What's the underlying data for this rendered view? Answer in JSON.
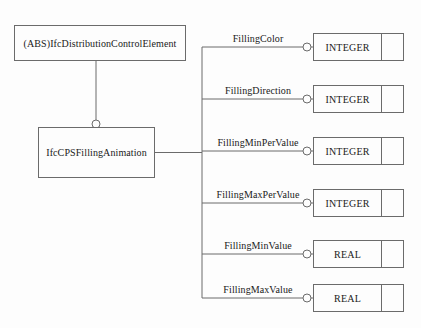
{
  "diagram": {
    "notation": "EXPRESS-G",
    "background_color": "#fdfdfd",
    "line_color": "#6b6b6b",
    "text_color": "#1a1a1a",
    "entities": [
      {
        "id": "parent",
        "label": "(ABS)IfcDistributionControlElement",
        "abstract": true,
        "x": 14,
        "y": 25,
        "width": 172,
        "height": 36
      },
      {
        "id": "child",
        "label": "IfcCPSFillingAnimation",
        "abstract": false,
        "x": 38,
        "y": 127,
        "width": 117,
        "height": 51
      }
    ],
    "inheritance": {
      "from": "child",
      "to": "parent",
      "marker": "circle"
    },
    "attributes": [
      {
        "name": "FillingColor",
        "type": "INTEGER",
        "row_y": 47,
        "label_x": 258
      },
      {
        "name": "FillingDirection",
        "type": "INTEGER",
        "row_y": 99,
        "label_x": 258
      },
      {
        "name": "FillingMinPerValue",
        "type": "INTEGER",
        "row_y": 151,
        "label_x": 258
      },
      {
        "name": "FillingMaxPerValue",
        "type": "INTEGER",
        "row_y": 203,
        "label_x": 258
      },
      {
        "name": "FillingMinValue",
        "type": "REAL",
        "row_y": 254,
        "label_x": 258
      },
      {
        "name": "FillingMaxValue",
        "type": "REAL",
        "row_y": 298,
        "label_x": 258
      }
    ],
    "geometry": {
      "trunk_x": 202,
      "type_box_left": 313,
      "type_box_right": 404,
      "type_box_height": 28,
      "connector_circle_x": 307,
      "connector_circle_r": 4,
      "inherit_circle_x": 96,
      "inherit_circle_y": 124,
      "inherit_circle_r": 4
    }
  }
}
